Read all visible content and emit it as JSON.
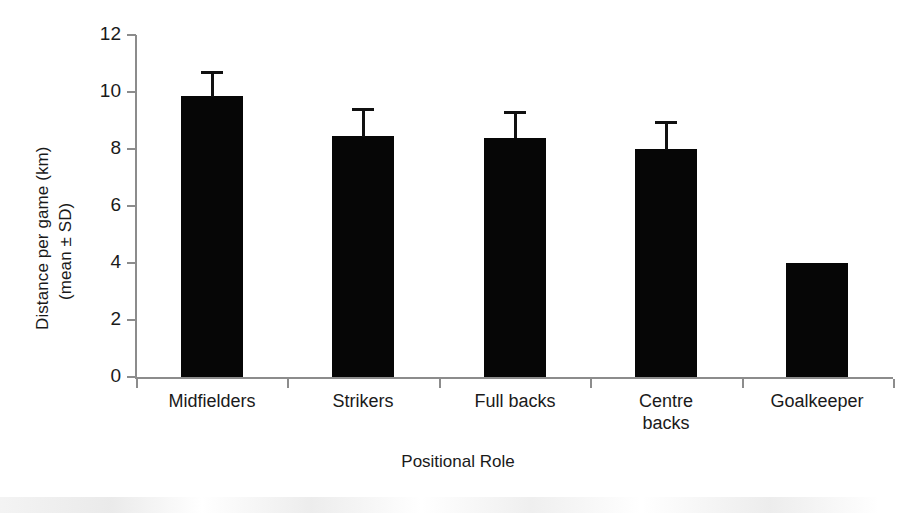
{
  "chart_data": {
    "type": "bar",
    "title": "",
    "xlabel": "Positional Role",
    "ylabel_line1": "Distance per game (km)",
    "ylabel_line2": "(mean ± SD)",
    "categories": [
      "Midfielders",
      "Strikers",
      "Full backs",
      "Centre backs",
      "Goalkeeper"
    ],
    "category_lines": [
      [
        "Midfielders"
      ],
      [
        "Strikers"
      ],
      [
        "Full backs"
      ],
      [
        "Centre",
        "backs"
      ],
      [
        "Goalkeeper"
      ]
    ],
    "values": [
      9.85,
      8.45,
      8.4,
      8.0,
      4.0
    ],
    "errors": [
      0.9,
      1.0,
      0.95,
      1.0,
      0
    ],
    "ylim": [
      0,
      12
    ],
    "yticks": [
      0,
      2,
      4,
      6,
      8,
      10,
      12
    ],
    "ytick_labels": [
      "0",
      "2",
      "4",
      "6",
      "8",
      "10",
      "12"
    ],
    "grid": false,
    "legend": null,
    "bar_color": "#060606",
    "axis_color": "#8c8c8c",
    "text_color": "#1a1a1a"
  }
}
